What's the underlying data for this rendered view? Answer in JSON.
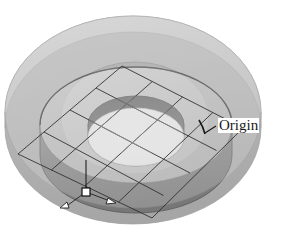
{
  "figure": {
    "type": "3d-render",
    "background_color": "#ffffff",
    "annotations": [
      {
        "id": "origin",
        "label": "Origin",
        "leader_line": true,
        "points_to": "inner solid ring edge at right"
      }
    ],
    "markers": {
      "origin_handle": {
        "shape": "square",
        "fill": "#ffffff",
        "stroke": "#1a1a1a"
      },
      "axis_arrows": [
        {
          "shape": "triangle",
          "fill": "#ffffff",
          "stroke": "#1a1a1a",
          "direction": "left"
        },
        {
          "shape": "triangle",
          "fill": "#ffffff",
          "stroke": "#1a1a1a",
          "direction": "right"
        }
      ]
    },
    "colors": {
      "shell_light": "#d2d2d2",
      "shell_mid": "#bdbdbd",
      "shell_dark": "#a8a8a8",
      "ring_top": "#cfcfcf",
      "ring_top_light": "#dcdcdc",
      "ring_outer_wall": "#9a9a9a",
      "ring_outer_wall_dark": "#7e7e7e",
      "inner_wall_dark": "#6e6e6e",
      "hole_floor": "#fdfdfd",
      "grid_line": "#2a2a2a",
      "outline": "#1f1f1f",
      "label_text": "#1a1a1a"
    },
    "geometry": {
      "outer_shell_center": [
        133,
        112
      ],
      "outer_shell_rx": 128,
      "outer_shell_ry": 96,
      "inner_ring_center": [
        136,
        125
      ],
      "inner_ring_rx": 96,
      "inner_ring_ry": 58,
      "hole_rx": 48,
      "hole_ry": 29,
      "ring_thickness_px": 30,
      "grid_plane_vertices": [
        [
          122,
          66
        ],
        [
          243,
          128
        ],
        [
          152,
          218
        ],
        [
          18,
          154
        ]
      ],
      "grid_divisions": 4
    }
  }
}
